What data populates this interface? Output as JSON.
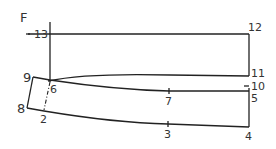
{
  "diagram": {
    "title": "F",
    "type": "pattern-draft",
    "points": [
      {
        "id": "13",
        "label": "13"
      },
      {
        "id": "12",
        "label": "12"
      },
      {
        "id": "11",
        "label": "11"
      },
      {
        "id": "10",
        "label": "10"
      },
      {
        "id": "9",
        "label": "9"
      },
      {
        "id": "8",
        "label": "8"
      },
      {
        "id": "7",
        "label": "7"
      },
      {
        "id": "6",
        "label": "6"
      },
      {
        "id": "5",
        "label": "5"
      },
      {
        "id": "4",
        "label": "4"
      },
      {
        "id": "3",
        "label": "3"
      },
      {
        "id": "2",
        "label": "2"
      }
    ],
    "colors": {
      "line": "#222222",
      "label": "#333333",
      "background": "#ffffff"
    }
  }
}
